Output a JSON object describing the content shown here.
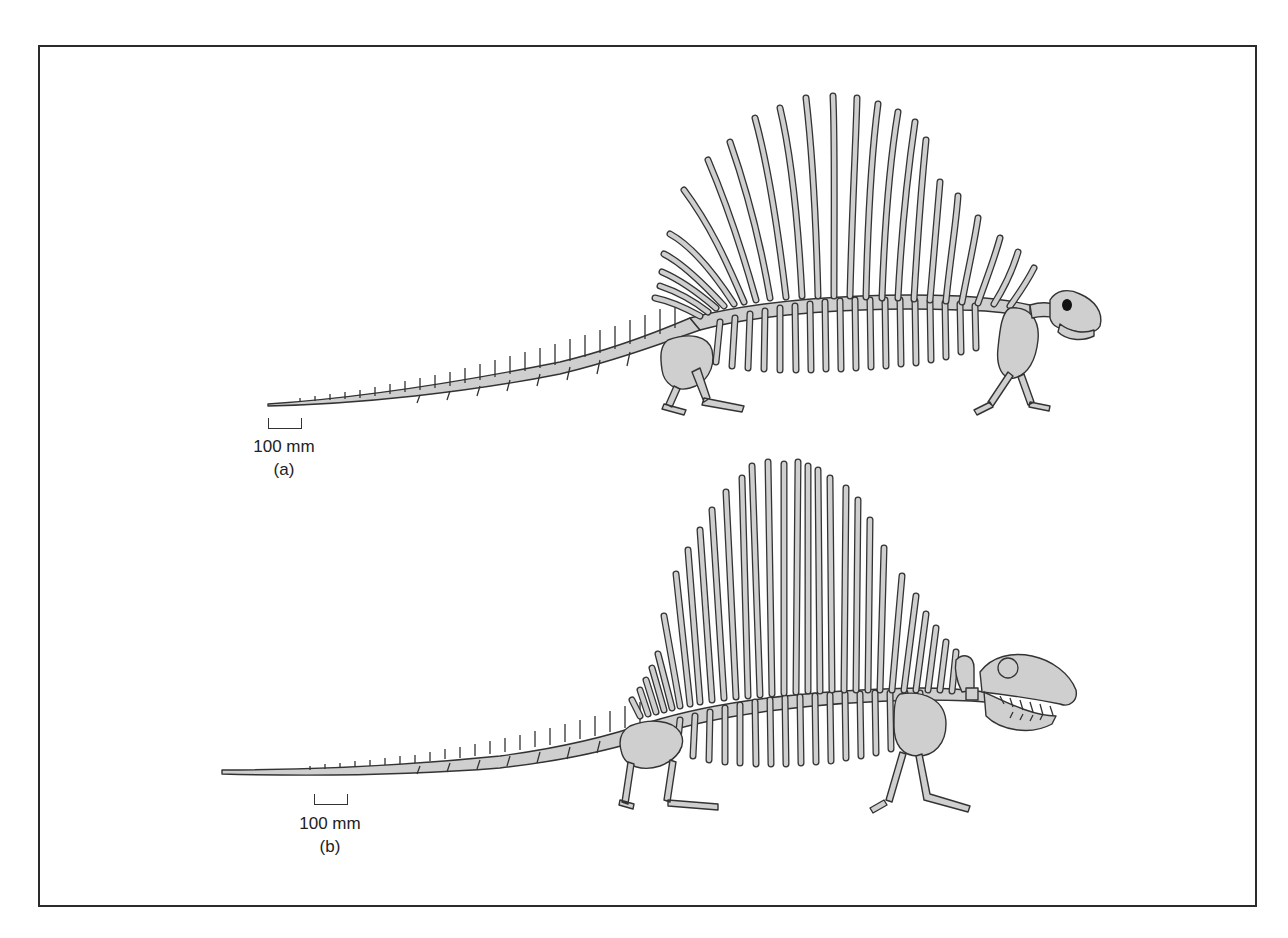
{
  "figure": {
    "panels": [
      {
        "id": "a",
        "label": "(a)",
        "scale_bar_text": "100 mm",
        "subject": "sail-backed synapsid skeleton, curved sail spines, lateral view"
      },
      {
        "id": "b",
        "label": "(b)",
        "scale_bar_text": "100 mm",
        "subject": "sail-backed synapsid skeleton, straight sail spines, large skull with teeth, lateral view"
      }
    ],
    "colors": {
      "bone_fill": "#cfcfcf",
      "bone_outline": "#333333",
      "frame_border": "#2b2b2b",
      "background": "#ffffff",
      "eye": "#111111"
    }
  }
}
